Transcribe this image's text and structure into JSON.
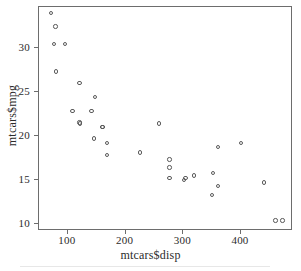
{
  "chart_data": {
    "type": "scatter",
    "title": "",
    "xlabel": "mtcars$disp",
    "ylabel": "mtcars$mpg",
    "xlim": [
      50,
      490
    ],
    "ylim": [
      9.2,
      34.6
    ],
    "xticks": [
      100,
      200,
      300,
      400
    ],
    "yticks": [
      10,
      15,
      20,
      25,
      30
    ],
    "xtick_labels": [
      "100",
      "200",
      "300",
      "400"
    ],
    "ytick_labels": [
      "10",
      "15",
      "20",
      "25",
      "30"
    ],
    "grid": false,
    "legend": null,
    "marker": "open-circle",
    "marker_color": "#5a5a5a",
    "x": [
      160,
      160,
      108,
      258,
      360,
      225,
      360,
      146.7,
      140.8,
      167.6,
      167.6,
      275.8,
      275.8,
      275.8,
      472,
      460,
      440,
      78.7,
      75.7,
      71.1,
      120.1,
      318,
      304,
      350,
      400,
      79,
      120.3,
      95.1,
      351,
      145,
      301,
      121
    ],
    "y": [
      21.0,
      21.0,
      22.8,
      21.4,
      18.7,
      18.1,
      14.3,
      24.4,
      22.8,
      19.2,
      17.8,
      16.4,
      17.3,
      15.2,
      10.4,
      10.4,
      14.7,
      32.4,
      30.4,
      33.9,
      21.5,
      15.5,
      15.2,
      13.3,
      19.2,
      27.3,
      26.0,
      30.4,
      15.8,
      19.7,
      15.0,
      21.4
    ],
    "n_points": 32,
    "axis_line_color": "#6d6d6d"
  },
  "axis": {
    "x_label": "mtcars$disp",
    "y_label": "mtcars$mpg"
  }
}
